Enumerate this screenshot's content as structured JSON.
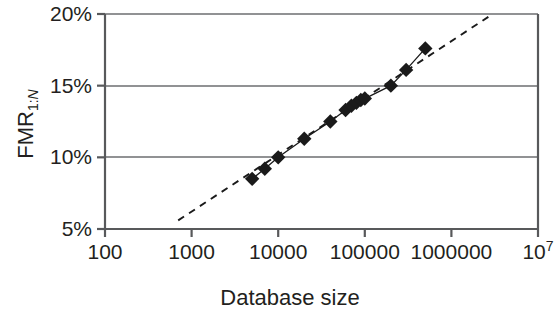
{
  "chart_data": {
    "type": "scatter",
    "title": "",
    "xlabel": "Database size",
    "ylabel": "FMR1:N",
    "ylabel_base": "FMR",
    "ylabel_sub_prefix": "1:",
    "ylabel_sub_italic": "N",
    "xscale": "log",
    "yscale": "linear",
    "xlim": [
      100,
      10000000
    ],
    "ylim": [
      5,
      20
    ],
    "grid": "horizontal",
    "legend": "none",
    "xtick_labels": [
      "100",
      "1000",
      "10000",
      "100000",
      "1000000",
      "10"
    ],
    "xtick_last_exponent": "7",
    "xtick_values": [
      100,
      1000,
      10000,
      100000,
      1000000,
      10000000
    ],
    "ytick_labels": [
      "20%",
      "15%",
      "10%",
      "5%"
    ],
    "ytick_values": [
      20,
      15,
      10,
      5
    ],
    "series": [
      {
        "name": "FMR measurements",
        "marker": "diamond",
        "marker_color": "#1a1a1a",
        "line": "solid",
        "x": [
          5000,
          7000,
          10000,
          20000,
          40000,
          60000,
          70000,
          80000,
          90000,
          100000,
          200000,
          300000,
          500000
        ],
        "y": [
          8.5,
          9.2,
          10.0,
          11.3,
          12.5,
          13.3,
          13.6,
          13.8,
          14.0,
          14.1,
          15.0,
          16.1,
          17.6
        ]
      }
    ],
    "trendline": {
      "name": "log-linear fit",
      "style": "dashed",
      "color": "#1a1a1a",
      "x_start": 700,
      "y_start": 5.6,
      "x_end": 3000000,
      "y_end": 20.0
    }
  },
  "axes": {
    "border_color": "#58595b",
    "grid_color": "#6d6e71",
    "plot_bg": "#ffffff"
  }
}
